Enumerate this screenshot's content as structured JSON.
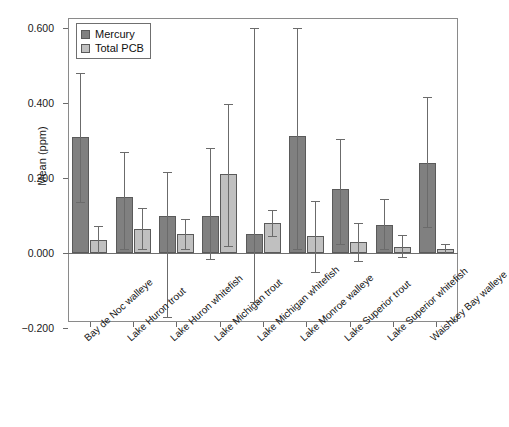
{
  "chart_data": {
    "type": "bar",
    "title": "",
    "xlabel": "",
    "ylabel": "Mean (ppm)",
    "ylim": [
      -0.2,
      0.68
    ],
    "yticks": [
      "0.600",
      "0.400",
      "0.200",
      "0.000",
      "−0.200"
    ],
    "ytick_values": [
      0.6,
      0.4,
      0.2,
      0.0,
      -0.2
    ],
    "grid": false,
    "legend_position": "top-left",
    "categories": [
      "Bay de Noc walleye",
      "Lake Huron trout",
      "Lake Huron whitefish",
      "Lake Michigan trout",
      "Lake Michigan whitefish",
      "Lake Monroe walleye",
      "Lake Superior trout",
      "Lake Superior whitefish",
      "Waishkey Bay walleye"
    ],
    "series": [
      {
        "name": "Mercury",
        "color": "#808080",
        "values": [
          0.31,
          0.15,
          0.1,
          0.1,
          0.05,
          0.312,
          0.17,
          0.075,
          0.24
        ],
        "err_low": [
          0.135,
          0.01,
          -0.17,
          -0.015,
          -0.13,
          0.01,
          0.025,
          0.01,
          0.07
        ],
        "err_high": [
          0.48,
          0.27,
          0.215,
          0.28,
          0.6,
          0.6,
          0.305,
          0.145,
          0.415
        ]
      },
      {
        "name": "Total PCB",
        "color": "#c0c0c0",
        "values": [
          0.035,
          0.065,
          0.05,
          0.21,
          0.08,
          0.045,
          0.03,
          0.017,
          0.01
        ],
        "err_low": [
          0.0,
          0.01,
          0.01,
          0.02,
          0.045,
          -0.05,
          -0.02,
          -0.01,
          0.0
        ],
        "err_high": [
          0.072,
          0.12,
          0.092,
          0.398,
          0.115,
          0.14,
          0.08,
          0.048,
          0.025
        ]
      }
    ]
  },
  "legend": {
    "items": [
      {
        "label": "Mercury",
        "swatch": "mercury"
      },
      {
        "label": "Total PCB",
        "swatch": "pcb"
      }
    ]
  }
}
